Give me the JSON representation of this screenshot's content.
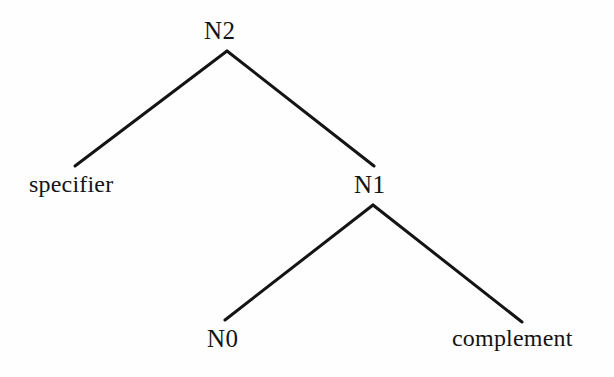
{
  "figure": {
    "kind": "x-bar-syntax-tree",
    "background_color": "#fefefe",
    "ink_color": "#141414"
  },
  "tree": {
    "nodes": {
      "root": {
        "label": "N2",
        "role": "maximal-projection"
      },
      "specifier": {
        "label": "specifier",
        "role": "specifier-position"
      },
      "bar": {
        "label": "N1",
        "role": "intermediate-projection"
      },
      "head": {
        "label": "N0",
        "role": "head"
      },
      "complement": {
        "label": "complement",
        "role": "complement-position"
      }
    },
    "edges": [
      {
        "from": "root",
        "to": "specifier"
      },
      {
        "from": "root",
        "to": "bar"
      },
      {
        "from": "bar",
        "to": "head"
      },
      {
        "from": "bar",
        "to": "complement"
      }
    ],
    "geometry": {
      "branch_color": "#141414",
      "branch_width": 3,
      "root_apex": {
        "x": 227,
        "y": 51
      },
      "specifier_end": {
        "x": 75,
        "y": 166
      },
      "bar_end": {
        "x": 374,
        "y": 166
      },
      "bar_apex": {
        "x": 373,
        "y": 205
      },
      "head_end": {
        "x": 225,
        "y": 320
      },
      "complement_end": {
        "x": 522,
        "y": 322
      }
    }
  }
}
